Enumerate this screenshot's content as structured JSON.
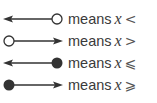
{
  "legend": {
    "rows": [
      {
        "id": "lt",
        "arrow": "left",
        "endpoint": "open",
        "word": "means",
        "variable": "x",
        "symbol": "<"
      },
      {
        "id": "gt",
        "arrow": "right",
        "endpoint": "open",
        "word": "means",
        "variable": "x",
        "symbol": ">"
      },
      {
        "id": "le",
        "arrow": "left",
        "endpoint": "closed",
        "word": "means",
        "variable": "x",
        "symbol": "⩽"
      },
      {
        "id": "ge",
        "arrow": "right",
        "endpoint": "closed",
        "word": "means",
        "variable": "x",
        "symbol": "⩾"
      }
    ]
  },
  "colors": {
    "line": "#333333",
    "text": "#3a3a3a"
  }
}
